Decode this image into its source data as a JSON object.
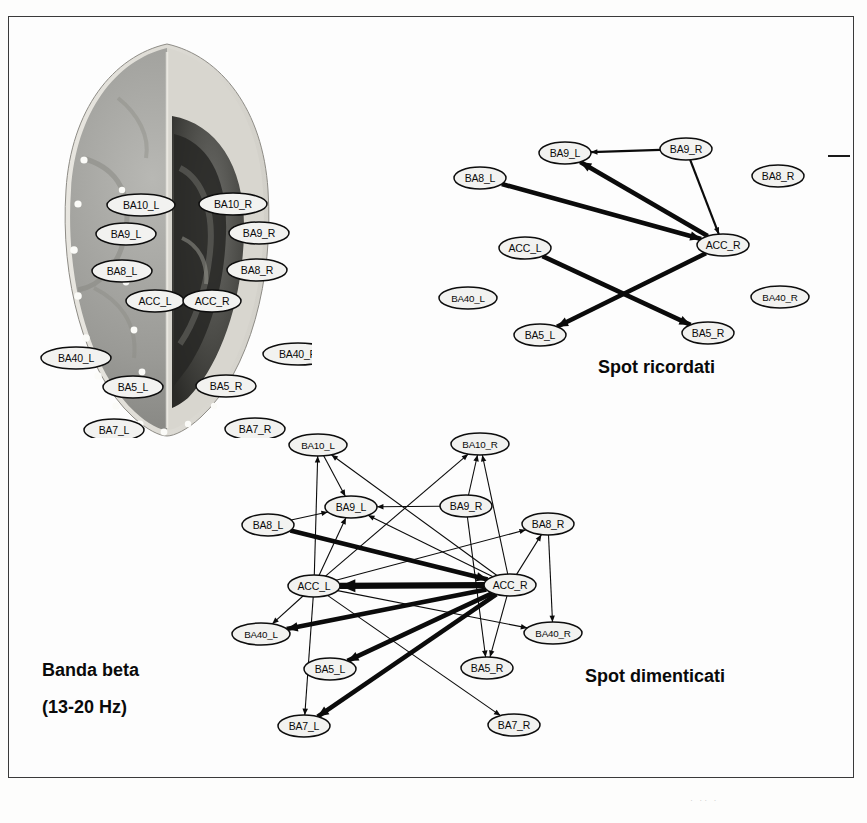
{
  "figure": {
    "band_label": "Banda beta",
    "frequency_label": "(13-20 Hz)",
    "legend_dash_name": "edge-weight-legend-dash"
  },
  "brain": {
    "title": "brain-surface-with-electrodes",
    "description": "Top-down brain render, left hemisphere light grey, right hemisphere dark, white electrode dots along the scalp",
    "labels": [
      {
        "id": "BA10_L",
        "text": "BA10_L",
        "x": 119,
        "y": 167
      },
      {
        "id": "BA9_L",
        "text": "BA9_L",
        "x": 104,
        "y": 196
      },
      {
        "id": "BA8_L",
        "text": "BA8_L",
        "x": 100,
        "y": 233
      },
      {
        "id": "ACC_L",
        "text": "ACC_L",
        "x": 133,
        "y": 263
      },
      {
        "id": "BA40_L",
        "text": "BA40_L",
        "x": 54,
        "y": 320
      },
      {
        "id": "BA5_L",
        "text": "BA5_L",
        "x": 111,
        "y": 349
      },
      {
        "id": "BA7_L",
        "text": "BA7_L",
        "x": 92,
        "y": 392
      },
      {
        "id": "BA10_R",
        "text": "BA10_R",
        "x": 211,
        "y": 166
      },
      {
        "id": "BA9_R",
        "text": "BA9_R",
        "x": 237,
        "y": 195
      },
      {
        "id": "BA8_R",
        "text": "BA8_R",
        "x": 235,
        "y": 232
      },
      {
        "id": "ACC_R",
        "text": "ACC_R",
        "x": 190,
        "y": 263
      },
      {
        "id": "BA40_R",
        "text": "BA40_R",
        "x": 276,
        "y": 316
      },
      {
        "id": "BA5_R",
        "text": "BA5_R",
        "x": 204,
        "y": 348
      },
      {
        "id": "BA7_R",
        "text": "BA7_R",
        "x": 233,
        "y": 391
      }
    ]
  },
  "network_remembered": {
    "caption": "Spot ricordati",
    "nodes": [
      {
        "id": "BA9_L",
        "label": "BA9_L",
        "x": 125,
        "y": 28
      },
      {
        "id": "BA9_R",
        "label": "BA9_R",
        "x": 246,
        "y": 24
      },
      {
        "id": "BA8_L",
        "label": "BA8_L",
        "x": 40,
        "y": 53
      },
      {
        "id": "BA8_R",
        "label": "BA8_R",
        "x": 338,
        "y": 51
      },
      {
        "id": "ACC_L",
        "label": "ACC_L",
        "x": 85,
        "y": 123
      },
      {
        "id": "ACC_R",
        "label": "ACC_R",
        "x": 283,
        "y": 120
      },
      {
        "id": "BA40_L",
        "label": "BA40_L",
        "x": 28,
        "y": 173
      },
      {
        "id": "BA40_R",
        "label": "BA40_R",
        "x": 340,
        "y": 172
      },
      {
        "id": "BA5_L",
        "label": "BA5_L",
        "x": 100,
        "y": 210
      },
      {
        "id": "BA5_R",
        "label": "BA5_R",
        "x": 268,
        "y": 208
      }
    ],
    "edges": [
      {
        "from": "BA9_R",
        "to": "BA9_L",
        "weight": "med"
      },
      {
        "from": "ACC_R",
        "to": "BA9_L",
        "weight": "thick"
      },
      {
        "from": "BA8_L",
        "to": "ACC_R",
        "weight": "thick"
      },
      {
        "from": "BA9_R",
        "to": "ACC_R",
        "weight": "med"
      },
      {
        "from": "ACC_L",
        "to": "BA5_R",
        "weight": "thick"
      },
      {
        "from": "ACC_R",
        "to": "BA5_L",
        "weight": "thick"
      }
    ]
  },
  "network_forgotten": {
    "caption": "Spot dimenticati",
    "nodes": [
      {
        "id": "BA10_L",
        "label": "BA10_L",
        "x": 90,
        "y": 20
      },
      {
        "id": "BA10_R",
        "label": "BA10_R",
        "x": 252,
        "y": 19
      },
      {
        "id": "BA9_L",
        "label": "BA9_L",
        "x": 123,
        "y": 82
      },
      {
        "id": "BA9_R",
        "label": "BA9_R",
        "x": 238,
        "y": 81
      },
      {
        "id": "BA8_L",
        "label": "BA8_L",
        "x": 40,
        "y": 100
      },
      {
        "id": "BA8_R",
        "label": "BA8_R",
        "x": 320,
        "y": 99
      },
      {
        "id": "ACC_L",
        "label": "ACC_L",
        "x": 86,
        "y": 161
      },
      {
        "id": "ACC_R",
        "label": "ACC_R",
        "x": 282,
        "y": 160
      },
      {
        "id": "BA40_L",
        "label": "BA40_L",
        "x": 33,
        "y": 209
      },
      {
        "id": "BA40_R",
        "label": "BA40_R",
        "x": 325,
        "y": 208
      },
      {
        "id": "BA5_L",
        "label": "BA5_L",
        "x": 102,
        "y": 244
      },
      {
        "id": "BA5_R",
        "label": "BA5_R",
        "x": 259,
        "y": 243
      },
      {
        "id": "BA7_L",
        "label": "BA7_L",
        "x": 76,
        "y": 301
      },
      {
        "id": "BA7_R",
        "label": "BA7_R",
        "x": 286,
        "y": 300
      }
    ],
    "edges": [
      {
        "from": "ACC_L",
        "to": "BA10_L",
        "weight": "thin"
      },
      {
        "from": "ACC_L",
        "to": "BA9_L",
        "weight": "thin"
      },
      {
        "from": "BA10_L",
        "to": "BA9_L",
        "weight": "thin"
      },
      {
        "from": "BA8_L",
        "to": "BA9_L",
        "weight": "thin"
      },
      {
        "from": "BA9_R",
        "to": "BA9_L",
        "weight": "thin"
      },
      {
        "from": "ACC_R",
        "to": "BA10_L",
        "weight": "thin"
      },
      {
        "from": "ACC_R",
        "to": "BA9_L",
        "weight": "thin"
      },
      {
        "from": "ACC_L",
        "to": "BA10_R",
        "weight": "thin"
      },
      {
        "from": "ACC_R",
        "to": "BA10_R",
        "weight": "thin"
      },
      {
        "from": "BA9_R",
        "to": "BA10_R",
        "weight": "thin"
      },
      {
        "from": "ACC_R",
        "to": "BA8_R",
        "weight": "thin"
      },
      {
        "from": "ACC_L",
        "to": "BA8_R",
        "weight": "thin"
      },
      {
        "from": "BA8_R",
        "to": "BA40_R",
        "weight": "thin"
      },
      {
        "from": "ACC_L",
        "to": "BA40_R",
        "weight": "thin"
      },
      {
        "from": "ACC_R",
        "to": "ACC_L",
        "weight": "xthick"
      },
      {
        "from": "BA8_L",
        "to": "ACC_R",
        "weight": "thick"
      },
      {
        "from": "ACC_R",
        "to": "BA40_L",
        "weight": "thick"
      },
      {
        "from": "ACC_R",
        "to": "BA5_L",
        "weight": "thick"
      },
      {
        "from": "ACC_R",
        "to": "BA7_L",
        "weight": "thick"
      },
      {
        "from": "ACC_L",
        "to": "BA40_L",
        "weight": "thin"
      },
      {
        "from": "ACC_L",
        "to": "BA7_L",
        "weight": "thin"
      },
      {
        "from": "ACC_L",
        "to": "BA7_R",
        "weight": "thin"
      },
      {
        "from": "ACC_R",
        "to": "BA5_R",
        "weight": "thin"
      },
      {
        "from": "BA9_R",
        "to": "BA5_R",
        "weight": "thin"
      }
    ]
  }
}
